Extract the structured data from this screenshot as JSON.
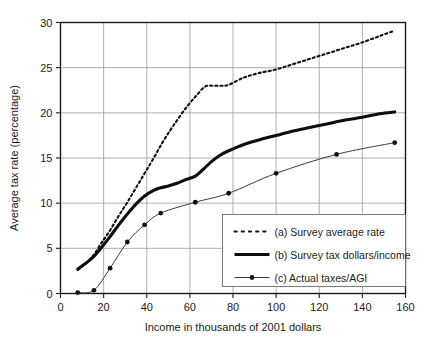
{
  "chart_data": {
    "type": "line",
    "title": "",
    "xlabel": "Income in thousands of 2001 dollars",
    "ylabel": "Average tax rate (percentage)",
    "xlim": [
      0,
      160
    ],
    "ylim": [
      0,
      30
    ],
    "xticks": [
      0,
      20,
      40,
      60,
      80,
      100,
      120,
      140,
      160
    ],
    "yticks": [
      0,
      5,
      10,
      15,
      20,
      25,
      30
    ],
    "grid": true,
    "legend_position": "lower right",
    "series": [
      {
        "name": "(a) Survey average rate",
        "key": "a",
        "style": "dotted",
        "markers": false,
        "x": [
          8,
          12,
          15.5,
          19,
          23,
          27,
          31,
          35,
          39,
          43,
          47,
          51,
          55,
          59,
          63,
          67,
          71,
          75,
          78,
          85,
          92,
          100,
          108,
          116,
          124,
          132,
          140,
          148,
          155
        ],
        "y": [
          2.6,
          3.4,
          4.3,
          5.6,
          7.0,
          8.6,
          10.1,
          11.7,
          13.3,
          14.9,
          16.6,
          18.1,
          19.5,
          20.8,
          21.9,
          22.9,
          23.0,
          23.0,
          23.1,
          23.9,
          24.4,
          24.8,
          25.4,
          26.0,
          26.6,
          27.2,
          27.8,
          28.5,
          29.1
        ]
      },
      {
        "name": "(b) Survey tax dollars/income",
        "key": "b",
        "style": "solid-thick",
        "markers": false,
        "x": [
          8,
          12,
          15.5,
          19,
          23,
          27,
          31,
          35,
          39,
          43,
          46.5,
          50,
          54,
          58,
          62.5,
          66,
          70,
          74,
          78,
          85,
          92,
          100,
          108,
          116,
          124,
          132,
          140,
          148,
          155
        ],
        "y": [
          2.7,
          3.4,
          4.1,
          5.1,
          6.3,
          7.6,
          8.8,
          9.9,
          10.8,
          11.4,
          11.7,
          11.9,
          12.2,
          12.6,
          13.0,
          13.7,
          14.6,
          15.3,
          15.8,
          16.5,
          17.0,
          17.5,
          18.0,
          18.4,
          18.8,
          19.2,
          19.5,
          19.9,
          20.1
        ]
      },
      {
        "name": "(c) Actual taxes/AGI",
        "key": "c",
        "style": "solid-thin-markers",
        "markers": true,
        "x": [
          8,
          15.5,
          23,
          31,
          39,
          46.5,
          62.5,
          78,
          100,
          128,
          155
        ],
        "y": [
          0.1,
          0.35,
          2.8,
          5.7,
          7.6,
          8.9,
          10.1,
          11.1,
          13.3,
          15.4,
          16.7
        ]
      }
    ]
  },
  "legend": {
    "items": [
      {
        "label": "(a) Survey average rate",
        "swatch": "dotted-line-swatch"
      },
      {
        "label": "(b) Survey tax dollars/income",
        "swatch": "thick-line-swatch"
      },
      {
        "label": "(c) Actual taxes/AGI",
        "swatch": "marker-line-swatch"
      }
    ]
  },
  "axes": {
    "x_tick_labels": [
      "0",
      "20",
      "40",
      "60",
      "80",
      "100",
      "120",
      "140",
      "160"
    ],
    "y_tick_labels": [
      "0",
      "5",
      "10",
      "15",
      "20",
      "25",
      "30"
    ],
    "x_axis_title": "Income in thousands of 2001 dollars",
    "y_axis_title": "Average tax rate (percentage)"
  },
  "colors": {
    "background": "#ffffff",
    "frame": "#1b1b1b",
    "grid": "#9a9a9a",
    "series_a": "#111111",
    "series_b": "#0d0d0d",
    "series_c": "#3a3a3a",
    "text": "#1b1b1b"
  }
}
